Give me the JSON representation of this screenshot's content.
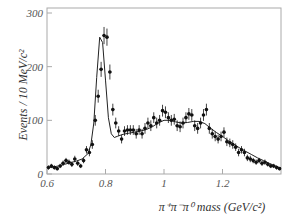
{
  "chart_data": {
    "type": "scatter",
    "title": "",
    "xlabel": "π⁺π⁻π⁰ mass (GeV/c²)",
    "ylabel": "Events / 10 MeV/c²",
    "xlim": [
      0.6,
      1.4
    ],
    "ylim": [
      0,
      300
    ],
    "grid": false,
    "legend": null,
    "x_ticks": [
      {
        "value": 0.6,
        "label": "0.6"
      },
      {
        "value": 0.8,
        "label": "0.8"
      },
      {
        "value": 1.0,
        "label": "1"
      },
      {
        "value": 1.2,
        "label": "1.2"
      }
    ],
    "y_ticks": [
      {
        "value": 0,
        "label": "0"
      },
      {
        "value": 100,
        "label": "100"
      },
      {
        "value": 200,
        "label": "200"
      },
      {
        "value": 300,
        "label": "300"
      }
    ],
    "series": [
      {
        "name": "data",
        "style": "points-with-error-bars",
        "x": [
          0.605,
          0.615,
          0.625,
          0.635,
          0.645,
          0.655,
          0.665,
          0.675,
          0.685,
          0.695,
          0.705,
          0.715,
          0.725,
          0.735,
          0.745,
          0.755,
          0.765,
          0.775,
          0.785,
          0.795,
          0.805,
          0.815,
          0.825,
          0.835,
          0.845,
          0.855,
          0.865,
          0.875,
          0.885,
          0.895,
          0.905,
          0.915,
          0.925,
          0.935,
          0.945,
          0.955,
          0.965,
          0.975,
          0.985,
          0.995,
          1.005,
          1.015,
          1.025,
          1.035,
          1.045,
          1.055,
          1.065,
          1.075,
          1.085,
          1.095,
          1.105,
          1.115,
          1.125,
          1.135,
          1.145,
          1.155,
          1.165,
          1.175,
          1.185,
          1.195,
          1.205,
          1.215,
          1.225,
          1.235,
          1.245,
          1.255,
          1.265,
          1.275,
          1.285,
          1.295,
          1.305,
          1.315,
          1.325,
          1.335,
          1.345,
          1.355,
          1.365,
          1.375,
          1.385,
          1.395
        ],
        "y": [
          12,
          15,
          12,
          10,
          15,
          20,
          25,
          22,
          18,
          28,
          20,
          15,
          25,
          45,
          40,
          55,
          100,
          145,
          195,
          258,
          255,
          190,
          120,
          95,
          80,
          65,
          80,
          82,
          82,
          82,
          75,
          82,
          75,
          85,
          95,
          90,
          105,
          95,
          100,
          118,
          115,
          105,
          100,
          102,
          90,
          88,
          95,
          105,
          112,
          110,
          90,
          85,
          95,
          110,
          120,
          85,
          75,
          70,
          65,
          70,
          78,
          60,
          58,
          55,
          50,
          40,
          45,
          40,
          30,
          28,
          25,
          22,
          25,
          20,
          22,
          18,
          15,
          15,
          12,
          10
        ],
        "errors": [
          4,
          4,
          4,
          3,
          4,
          5,
          5,
          5,
          5,
          6,
          5,
          4,
          5,
          7,
          7,
          8,
          10,
          12,
          14,
          16,
          16,
          14,
          11,
          10,
          9,
          8,
          9,
          9,
          9,
          9,
          9,
          9,
          9,
          10,
          10,
          10,
          10,
          10,
          10,
          11,
          11,
          10,
          10,
          10,
          10,
          10,
          10,
          10,
          11,
          11,
          10,
          10,
          10,
          11,
          11,
          10,
          9,
          9,
          8,
          9,
          9,
          8,
          8,
          8,
          7,
          7,
          7,
          7,
          6,
          6,
          5,
          5,
          5,
          5,
          5,
          4,
          4,
          4,
          4,
          3
        ]
      },
      {
        "name": "fit",
        "style": "line",
        "x": [
          0.6,
          0.62,
          0.64,
          0.66,
          0.68,
          0.7,
          0.72,
          0.74,
          0.75,
          0.76,
          0.77,
          0.78,
          0.79,
          0.8,
          0.81,
          0.82,
          0.83,
          0.84,
          0.86,
          0.88,
          0.9,
          0.92,
          0.94,
          0.96,
          0.98,
          1.0,
          1.02,
          1.04,
          1.06,
          1.08,
          1.1,
          1.12,
          1.14,
          1.16,
          1.18,
          1.2,
          1.22,
          1.24,
          1.26,
          1.28,
          1.3,
          1.32,
          1.34,
          1.36,
          1.38,
          1.4
        ],
        "y": [
          12,
          13,
          15,
          18,
          21,
          24,
          28,
          38,
          55,
          95,
          180,
          255,
          245,
          175,
          105,
          75,
          68,
          70,
          74,
          76,
          78,
          80,
          83,
          88,
          95,
          100,
          100,
          97,
          95,
          96,
          98,
          98,
          94,
          85,
          77,
          70,
          62,
          55,
          48,
          42,
          36,
          30,
          25,
          20,
          15,
          11
        ]
      }
    ]
  }
}
